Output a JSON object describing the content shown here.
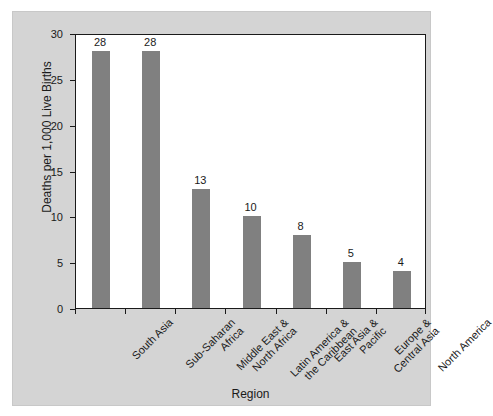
{
  "chart_data": {
    "type": "bar",
    "title": "",
    "subtitle": "",
    "xlabel": "Region",
    "ylabel": "Deaths per 1,000 Live Births",
    "categories": [
      "South Asia",
      "Sub-Saharan Africa",
      "Middle East & North Africa",
      "Latin America & the Caribbean",
      "East Asia & Pacific",
      "Europe & Central Asia",
      "North America"
    ],
    "category_lines": [
      [
        "South Asia"
      ],
      [
        "Sub-Saharan",
        "Africa"
      ],
      [
        "Middle East &",
        "North Africa"
      ],
      [
        "Latin America &",
        "the Caribbean"
      ],
      [
        "East Asia &",
        "Pacific"
      ],
      [
        "Europe &",
        "Central Asia"
      ],
      [
        "North America"
      ]
    ],
    "values": [
      28,
      28,
      13,
      10,
      8,
      5,
      4
    ],
    "value_labels": [
      "28",
      "28",
      "13",
      "10",
      "8",
      "5",
      "4"
    ],
    "ylim": [
      0,
      30
    ],
    "yticks": [
      0,
      5,
      10,
      15,
      20,
      25,
      30
    ],
    "ytick_labels": [
      "0",
      "5",
      "10",
      "15",
      "20",
      "25",
      "30"
    ],
    "grid": false,
    "legend": "none",
    "bar_color": "#808080",
    "plot_background": "#ffffff",
    "figure_background": "#d4d4d4",
    "axis_color": "#1a1a1a"
  }
}
